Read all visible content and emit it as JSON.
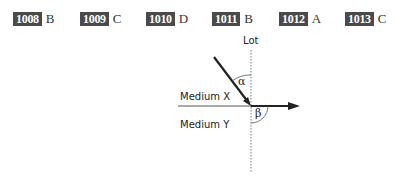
{
  "answers": [
    {
      "number": "1008",
      "letter": "B"
    },
    {
      "number": "1009",
      "letter": "C"
    },
    {
      "number": "1010",
      "letter": "D"
    },
    {
      "number": "1011",
      "letter": "B"
    },
    {
      "number": "1012",
      "letter": "A"
    },
    {
      "number": "1013",
      "letter": "C"
    }
  ],
  "diagram": {
    "normal_label": "Lot",
    "medium_top_label": "Medium X",
    "medium_bottom_label": "Medium Y",
    "angle_incident": "α",
    "angle_refracted": "β"
  }
}
